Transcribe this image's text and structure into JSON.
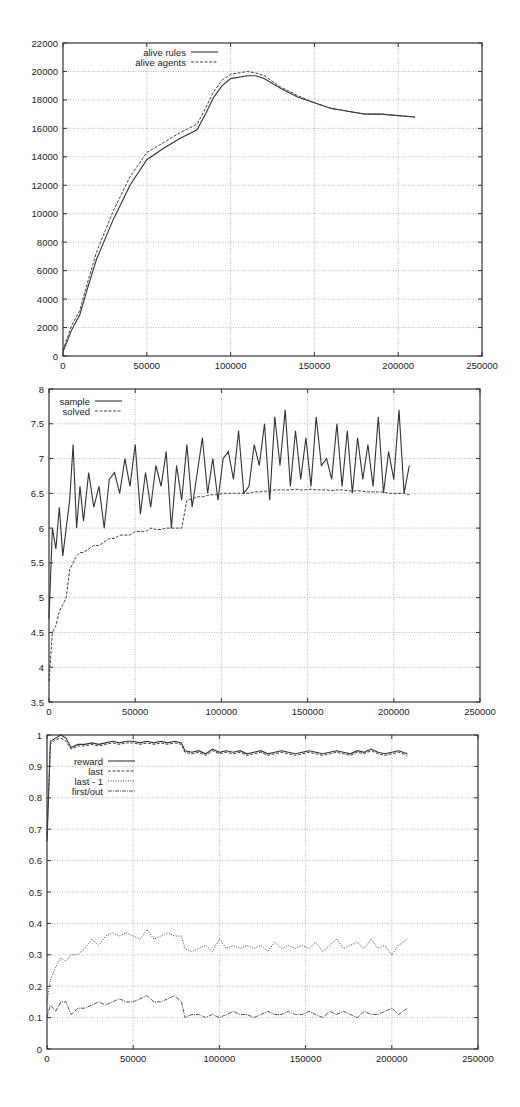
{
  "chart_data": [
    {
      "type": "line",
      "title": "",
      "xlabel": "",
      "ylabel": "",
      "xlim": [
        0,
        250000
      ],
      "ylim": [
        0,
        22000
      ],
      "xticks": [
        0,
        50000,
        100000,
        150000,
        200000,
        250000
      ],
      "yticks": [
        0,
        2000,
        4000,
        6000,
        8000,
        10000,
        12000,
        14000,
        16000,
        18000,
        20000,
        22000
      ],
      "grid": true,
      "legend_position": "top-left",
      "x": [
        0,
        5000,
        10000,
        15000,
        20000,
        30000,
        40000,
        50000,
        60000,
        70000,
        80000,
        85000,
        90000,
        95000,
        100000,
        110000,
        115000,
        120000,
        130000,
        140000,
        150000,
        160000,
        170000,
        180000,
        190000,
        200000,
        210000
      ],
      "series": [
        {
          "name": "alive rules",
          "style": "solid",
          "values": [
            300,
            1800,
            2900,
            4900,
            6800,
            9600,
            12000,
            13800,
            14600,
            15300,
            15900,
            17000,
            18200,
            19000,
            19500,
            19700,
            19700,
            19500,
            18800,
            18200,
            17800,
            17400,
            17200,
            17000,
            17000,
            16900,
            16800
          ]
        },
        {
          "name": "alive agents",
          "style": "dashed",
          "values": [
            400,
            2100,
            3200,
            5300,
            7300,
            10200,
            12600,
            14300,
            15000,
            15700,
            16300,
            17400,
            18600,
            19400,
            19800,
            20000,
            19900,
            19700,
            18900,
            18300,
            17800,
            17400,
            17200,
            17000,
            17000,
            16900,
            16800
          ]
        }
      ]
    },
    {
      "type": "line",
      "title": "",
      "xlabel": "",
      "ylabel": "",
      "xlim": [
        0,
        250000
      ],
      "ylim": [
        3.5,
        8
      ],
      "xticks": [
        0,
        50000,
        100000,
        150000,
        200000,
        250000
      ],
      "yticks": [
        3.5,
        4,
        4.5,
        5,
        5.5,
        6,
        6.5,
        7,
        7.5,
        8
      ],
      "grid": true,
      "legend_position": "top-left",
      "x": [
        0,
        2000,
        4000,
        6000,
        8000,
        10000,
        12000,
        14000,
        16000,
        18000,
        20000,
        23000,
        26000,
        29000,
        32000,
        35000,
        38000,
        41000,
        44000,
        47000,
        50000,
        53000,
        56000,
        59000,
        62000,
        65000,
        68000,
        71000,
        74000,
        77000,
        80000,
        83000,
        86000,
        89000,
        92000,
        95000,
        98000,
        101000,
        104000,
        107000,
        110000,
        113000,
        116000,
        119000,
        122000,
        125000,
        128000,
        131000,
        134000,
        137000,
        140000,
        143000,
        146000,
        149000,
        152000,
        155000,
        158000,
        161000,
        164000,
        167000,
        170000,
        173000,
        176000,
        179000,
        182000,
        185000,
        188000,
        191000,
        194000,
        197000,
        200000,
        203000,
        206000,
        209000
      ],
      "series": [
        {
          "name": "sample",
          "style": "solid",
          "values": [
            4.7,
            6.0,
            5.7,
            6.3,
            5.6,
            6.0,
            6.4,
            7.2,
            6.0,
            6.6,
            6.1,
            6.8,
            6.3,
            6.6,
            6.0,
            6.7,
            6.8,
            6.5,
            7.0,
            6.6,
            7.2,
            6.2,
            6.8,
            6.3,
            6.9,
            6.6,
            7.1,
            6.0,
            6.9,
            6.4,
            7.2,
            6.3,
            6.8,
            7.3,
            6.5,
            7.0,
            6.4,
            7.0,
            7.1,
            6.7,
            7.4,
            6.5,
            6.6,
            7.2,
            6.9,
            7.5,
            6.4,
            7.6,
            6.9,
            7.7,
            6.6,
            7.4,
            6.7,
            7.3,
            6.6,
            7.6,
            6.9,
            7.0,
            6.7,
            7.5,
            6.6,
            7.4,
            6.5,
            7.3,
            6.7,
            7.2,
            6.6,
            7.6,
            6.5,
            7.1,
            6.7,
            7.7,
            6.5,
            6.9
          ]
        },
        {
          "name": "solved",
          "style": "dashed",
          "values": [
            3.8,
            4.5,
            4.6,
            4.8,
            4.9,
            5.0,
            5.4,
            5.5,
            5.6,
            5.65,
            5.65,
            5.7,
            5.75,
            5.75,
            5.8,
            5.85,
            5.85,
            5.9,
            5.9,
            5.9,
            5.95,
            5.95,
            5.95,
            6.0,
            5.98,
            5.98,
            6.0,
            6.0,
            6.0,
            6.0,
            6.4,
            6.42,
            6.45,
            6.45,
            6.47,
            6.48,
            6.48,
            6.5,
            6.5,
            6.5,
            6.5,
            6.5,
            6.5,
            6.52,
            6.52,
            6.53,
            6.53,
            6.55,
            6.55,
            6.55,
            6.55,
            6.56,
            6.55,
            6.55,
            6.56,
            6.55,
            6.55,
            6.55,
            6.54,
            6.55,
            6.55,
            6.54,
            6.53,
            6.54,
            6.53,
            6.52,
            6.52,
            6.52,
            6.52,
            6.5,
            6.5,
            6.5,
            6.5,
            6.48
          ]
        }
      ]
    },
    {
      "type": "line",
      "title": "",
      "xlabel": "",
      "ylabel": "",
      "xlim": [
        0,
        250000
      ],
      "ylim": [
        0,
        1
      ],
      "xticks": [
        0,
        50000,
        100000,
        150000,
        200000,
        250000
      ],
      "yticks": [
        0,
        0.1,
        0.2,
        0.3,
        0.4,
        0.5,
        0.6,
        0.7,
        0.8,
        0.9,
        1
      ],
      "grid": true,
      "legend_position": "top-left",
      "x": [
        0,
        2000,
        5000,
        8000,
        11000,
        14000,
        18000,
        22000,
        26000,
        30000,
        34000,
        38000,
        42000,
        46000,
        50000,
        54000,
        58000,
        62000,
        66000,
        70000,
        74000,
        78000,
        80000,
        84000,
        88000,
        92000,
        96000,
        100000,
        104000,
        108000,
        112000,
        116000,
        120000,
        124000,
        128000,
        132000,
        136000,
        140000,
        144000,
        148000,
        152000,
        156000,
        160000,
        164000,
        168000,
        172000,
        176000,
        180000,
        184000,
        188000,
        192000,
        196000,
        200000,
        204000,
        209000
      ],
      "series": [
        {
          "name": "reward",
          "style": "solid",
          "values": [
            0.66,
            0.98,
            0.99,
            1.0,
            0.99,
            0.96,
            0.97,
            0.97,
            0.975,
            0.97,
            0.975,
            0.98,
            0.975,
            0.98,
            0.98,
            0.975,
            0.98,
            0.975,
            0.98,
            0.975,
            0.98,
            0.975,
            0.95,
            0.945,
            0.95,
            0.94,
            0.955,
            0.945,
            0.95,
            0.945,
            0.95,
            0.94,
            0.945,
            0.95,
            0.94,
            0.945,
            0.95,
            0.945,
            0.94,
            0.945,
            0.95,
            0.945,
            0.94,
            0.945,
            0.95,
            0.945,
            0.94,
            0.95,
            0.945,
            0.955,
            0.945,
            0.94,
            0.945,
            0.95,
            0.94
          ]
        },
        {
          "name": "last",
          "style": "dashed",
          "values": [
            0.68,
            0.97,
            0.985,
            0.99,
            0.98,
            0.955,
            0.965,
            0.965,
            0.97,
            0.965,
            0.97,
            0.975,
            0.97,
            0.975,
            0.975,
            0.97,
            0.975,
            0.97,
            0.975,
            0.97,
            0.975,
            0.97,
            0.945,
            0.94,
            0.945,
            0.935,
            0.95,
            0.94,
            0.945,
            0.94,
            0.945,
            0.935,
            0.94,
            0.945,
            0.935,
            0.94,
            0.945,
            0.94,
            0.935,
            0.94,
            0.945,
            0.94,
            0.935,
            0.94,
            0.945,
            0.94,
            0.935,
            0.945,
            0.94,
            0.95,
            0.94,
            0.935,
            0.94,
            0.945,
            0.935
          ]
        },
        {
          "name": "last - 1",
          "style": "dotted",
          "values": [
            0.15,
            0.22,
            0.26,
            0.29,
            0.28,
            0.3,
            0.3,
            0.32,
            0.35,
            0.33,
            0.36,
            0.37,
            0.36,
            0.37,
            0.36,
            0.35,
            0.38,
            0.35,
            0.36,
            0.37,
            0.36,
            0.36,
            0.32,
            0.31,
            0.32,
            0.33,
            0.31,
            0.35,
            0.32,
            0.33,
            0.32,
            0.33,
            0.32,
            0.33,
            0.31,
            0.34,
            0.32,
            0.33,
            0.32,
            0.33,
            0.32,
            0.34,
            0.31,
            0.33,
            0.35,
            0.32,
            0.33,
            0.34,
            0.32,
            0.35,
            0.32,
            0.33,
            0.3,
            0.33,
            0.35
          ]
        },
        {
          "name": "first/out",
          "style": "dashdot",
          "values": [
            0.1,
            0.14,
            0.12,
            0.15,
            0.15,
            0.11,
            0.13,
            0.13,
            0.14,
            0.15,
            0.14,
            0.15,
            0.16,
            0.15,
            0.15,
            0.16,
            0.17,
            0.15,
            0.15,
            0.16,
            0.17,
            0.15,
            0.1,
            0.11,
            0.11,
            0.1,
            0.11,
            0.1,
            0.11,
            0.12,
            0.11,
            0.11,
            0.1,
            0.11,
            0.12,
            0.11,
            0.11,
            0.12,
            0.11,
            0.11,
            0.12,
            0.11,
            0.1,
            0.12,
            0.11,
            0.12,
            0.11,
            0.1,
            0.12,
            0.11,
            0.11,
            0.12,
            0.13,
            0.11,
            0.13
          ]
        }
      ]
    }
  ],
  "layout": [
    {
      "top": 14,
      "plot": {
        "left": 63,
        "top": 29,
        "right": 482,
        "bottom": 342
      },
      "legend": {
        "x": 186,
        "y": 38,
        "rowH": 10
      }
    },
    {
      "top": 374,
      "plot": {
        "left": 49,
        "top": 15,
        "right": 480,
        "bottom": 328
      },
      "legend": {
        "x": 90,
        "y": 27,
        "rowH": 10
      }
    },
    {
      "top": 720,
      "plot": {
        "left": 47,
        "top": 15,
        "right": 478,
        "bottom": 329
      },
      "legend": {
        "x": 103,
        "y": 41,
        "rowH": 10
      }
    }
  ]
}
